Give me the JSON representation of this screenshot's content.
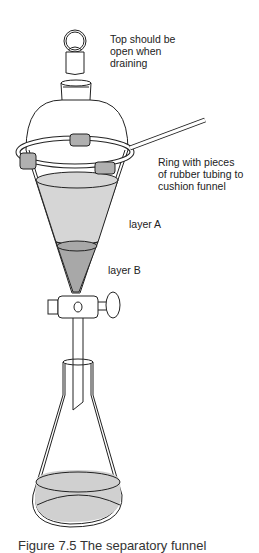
{
  "diagram": {
    "labels": {
      "stopper": "Top should be\nopen when\ndraining",
      "ring": "Ring with pieces\nof rubber tubing to\ncushion funnel",
      "layer_a": "layer A",
      "layer_b": "layer B"
    },
    "caption": "Figure 7.5  The separatory funnel",
    "colors": {
      "line": "#222222",
      "layer_a_fill": "#d6d6d6",
      "layer_b_fill": "#a8a8a8",
      "tubing_fill": "#b0b0b0",
      "flask_liquid": "#d0d0d0"
    }
  }
}
